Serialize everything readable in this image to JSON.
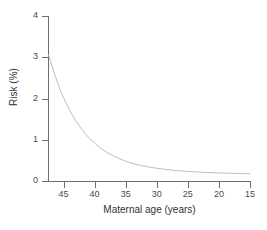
{
  "chart_data": {
    "type": "line",
    "title": "",
    "xlabel": "Maternal age (years)",
    "ylabel": "Risk (%)",
    "xlim": [
      47.5,
      15
    ],
    "ylim": [
      0,
      4
    ],
    "x_reversed": true,
    "grid": false,
    "legend": "none",
    "xticks": [
      45,
      40,
      35,
      30,
      25,
      20,
      15
    ],
    "xticklabels": [
      "45",
      "40",
      "35",
      "30",
      "25",
      "20",
      "15"
    ],
    "yticks": [
      0,
      1,
      2,
      3,
      4
    ],
    "yticklabels": [
      "0",
      "1",
      "2",
      "3",
      "4"
    ],
    "series": [
      {
        "name": "Risk",
        "color": "#bdbdbd",
        "x": [
          47.4,
          47,
          46.5,
          46,
          45.5,
          45,
          44.5,
          44,
          43.5,
          43,
          42.5,
          42,
          41.5,
          41,
          40.5,
          40,
          39,
          38,
          37,
          36,
          35,
          34,
          33,
          32,
          31,
          30,
          29,
          28,
          27,
          26,
          25,
          24,
          23,
          22,
          21,
          20,
          19,
          18,
          17,
          16,
          15
        ],
        "y": [
          3.05,
          2.86,
          2.62,
          2.4,
          2.2,
          2.02,
          1.86,
          1.71,
          1.58,
          1.45,
          1.34,
          1.24,
          1.15,
          1.06,
          0.99,
          0.92,
          0.79,
          0.69,
          0.61,
          0.54,
          0.48,
          0.43,
          0.39,
          0.36,
          0.33,
          0.31,
          0.29,
          0.27,
          0.255,
          0.243,
          0.232,
          0.223,
          0.215,
          0.208,
          0.202,
          0.196,
          0.191,
          0.187,
          0.183,
          0.179,
          0.176
        ]
      }
    ],
    "annotations": []
  },
  "colors": {
    "axis": "#6e6e6e",
    "text": "#4a4a4a",
    "curve": "#bdbdbd",
    "background": "#ffffff"
  }
}
